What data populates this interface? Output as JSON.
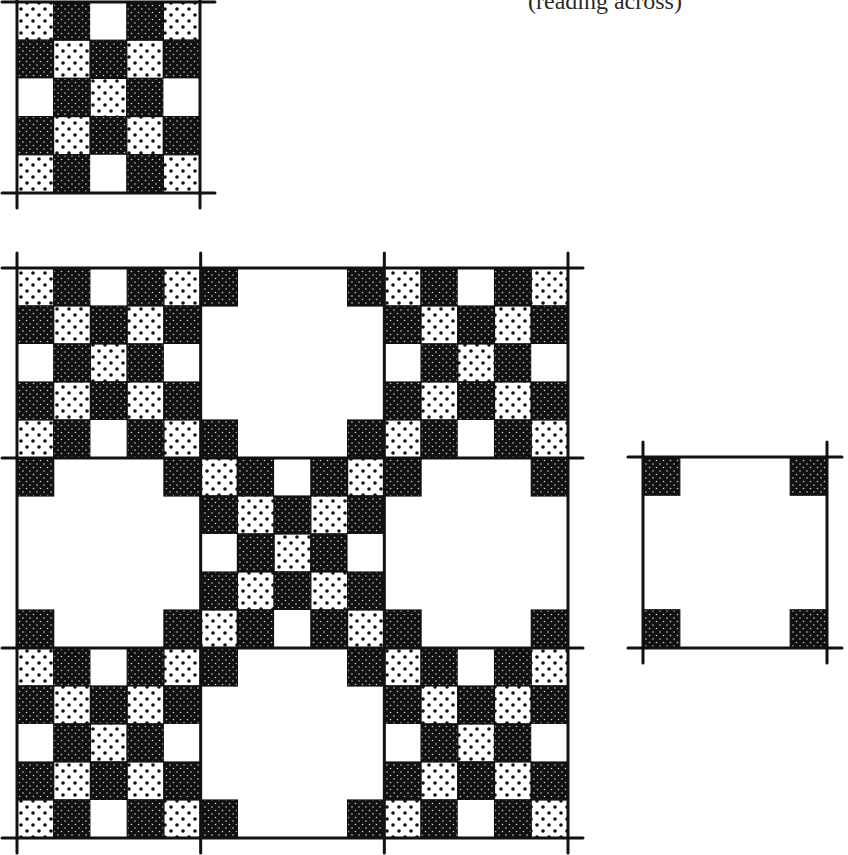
{
  "caption": "(reading across)",
  "colors": {
    "ink": "#111111",
    "paper": "#ffffff",
    "dot_on_dark": "#cfcfcf",
    "dot_on_light": "#111111"
  },
  "legend_cell_types": {
    "B": "black-dotted",
    "D": "white-with-black-dots",
    "W": "plain-white"
  },
  "checker_block": {
    "rows": 5,
    "cols": 5,
    "pattern": [
      [
        "D",
        "B",
        "W",
        "B",
        "D"
      ],
      [
        "B",
        "D",
        "B",
        "D",
        "B"
      ],
      [
        "W",
        "B",
        "D",
        "B",
        "W"
      ],
      [
        "B",
        "D",
        "B",
        "D",
        "B"
      ],
      [
        "D",
        "B",
        "W",
        "B",
        "D"
      ]
    ]
  },
  "plain_block": {
    "description": "white square with four black-dotted corner squares",
    "corner_cell_fraction": 0.2
  },
  "figures": [
    {
      "name": "single-checker-block",
      "x": 17,
      "y": 2,
      "w": 183,
      "h": 191,
      "layout": [
        [
          "checker"
        ]
      ]
    },
    {
      "name": "quilt-3x3",
      "x": 17,
      "y": 268,
      "w": 551,
      "h": 570,
      "layout": [
        [
          "checker",
          "plain",
          "checker"
        ],
        [
          "plain",
          "checker",
          "plain"
        ],
        [
          "checker",
          "plain",
          "checker"
        ]
      ]
    },
    {
      "name": "single-plain-block",
      "x": 643,
      "y": 457,
      "w": 184,
      "h": 191,
      "layout": [
        [
          "plain"
        ]
      ]
    }
  ]
}
